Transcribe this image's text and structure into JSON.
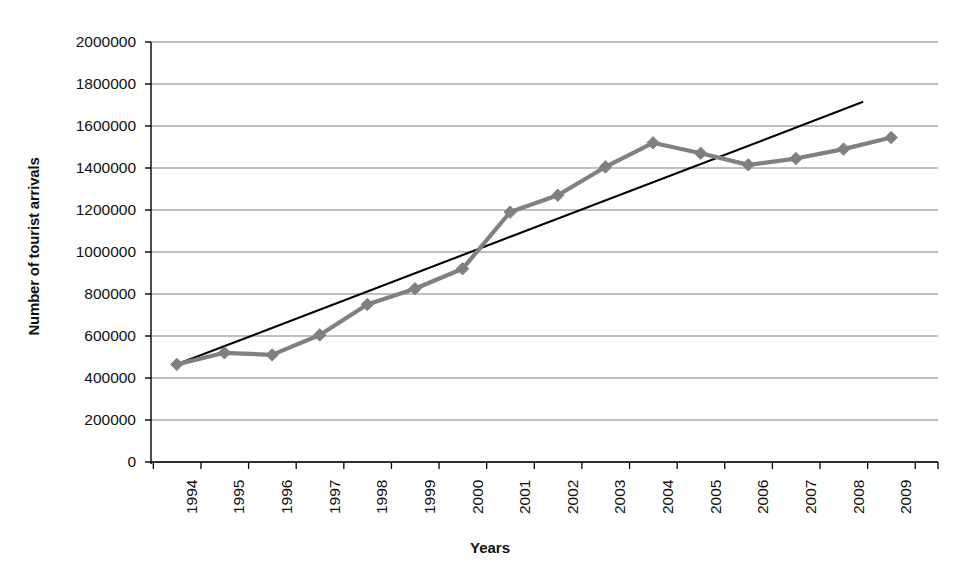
{
  "chart_data": {
    "type": "line",
    "title": "",
    "xlabel": "Years",
    "ylabel": "Number of tourist arrivals",
    "categories": [
      "1994",
      "1995",
      "1996",
      "1997",
      "1998",
      "1999",
      "2000",
      "2001",
      "2002",
      "2003",
      "2004",
      "2005",
      "2006",
      "2007",
      "2008",
      "2009"
    ],
    "series": [
      {
        "name": "Number of tourist arrivals",
        "color": "#808080",
        "marker": "diamond",
        "values": [
          465000,
          520000,
          510000,
          605000,
          750000,
          825000,
          920000,
          1190000,
          1270000,
          1405000,
          1520000,
          1470000,
          1415000,
          1445000,
          1490000,
          1545000
        ]
      },
      {
        "name": "Linear trendline",
        "color": "#000000",
        "marker": "none",
        "type": "trendline",
        "values": [
          465000,
          548000,
          631000,
          715000,
          798000,
          881000,
          965000,
          1048000,
          1131000,
          1215000,
          1298000,
          1381000,
          1465000,
          1548000,
          1631000,
          1715000
        ]
      }
    ],
    "ylim": [
      0,
      2000000
    ],
    "yticks": [
      "0",
      "200000",
      "400000",
      "600000",
      "800000",
      "1000000",
      "1200000",
      "1400000",
      "1600000",
      "1800000",
      "2000000"
    ],
    "ytick_values": [
      0,
      200000,
      400000,
      600000,
      800000,
      1000000,
      1200000,
      1400000,
      1600000,
      1800000,
      2000000
    ],
    "grid": true,
    "grid_axis": "y",
    "legend": "none",
    "legend_position": "none",
    "axis_color": "#000000",
    "grid_color": "#808080",
    "background": "#ffffff"
  }
}
